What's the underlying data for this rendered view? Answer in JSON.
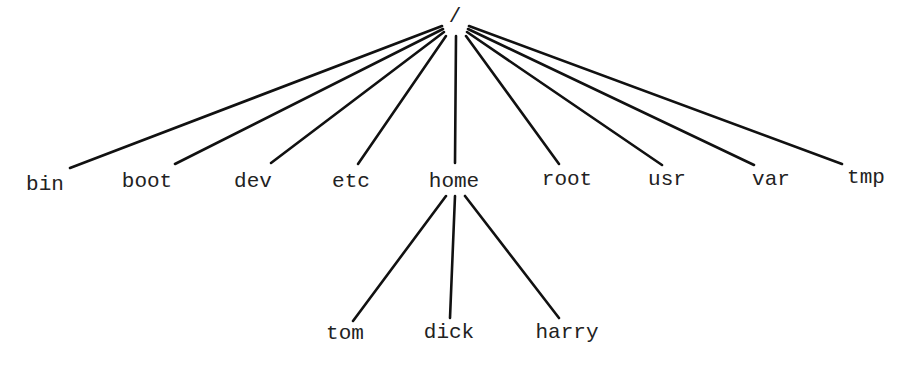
{
  "diagram": {
    "type": "tree",
    "colors": {
      "line": "#111111",
      "text": "#222222",
      "background": "#ffffff"
    },
    "nodes": [
      {
        "id": "root",
        "label": "/",
        "x": 455,
        "y": 22
      },
      {
        "id": "bin",
        "label": "bin",
        "x": 45,
        "y": 190
      },
      {
        "id": "boot",
        "label": "boot",
        "x": 147,
        "y": 187
      },
      {
        "id": "dev",
        "label": "dev",
        "x": 253,
        "y": 187
      },
      {
        "id": "etc",
        "label": "etc",
        "x": 351,
        "y": 187
      },
      {
        "id": "home",
        "label": "home",
        "x": 454,
        "y": 187
      },
      {
        "id": "rootdir",
        "label": "root",
        "x": 567,
        "y": 185
      },
      {
        "id": "usr",
        "label": "usr",
        "x": 667,
        "y": 185
      },
      {
        "id": "var",
        "label": "var",
        "x": 771,
        "y": 185
      },
      {
        "id": "tmp",
        "label": "tmp",
        "x": 866,
        "y": 183
      },
      {
        "id": "tom",
        "label": "tom",
        "x": 345,
        "y": 339
      },
      {
        "id": "dick",
        "label": "dick",
        "x": 449,
        "y": 338
      },
      {
        "id": "harry",
        "label": "harry",
        "x": 567,
        "y": 338
      }
    ],
    "edges": [
      {
        "from": "root",
        "to": "bin",
        "x1": 442,
        "y1": 26,
        "x2": 70,
        "y2": 168
      },
      {
        "from": "root",
        "to": "boot",
        "x1": 443,
        "y1": 29,
        "x2": 175,
        "y2": 164
      },
      {
        "from": "root",
        "to": "dev",
        "x1": 444,
        "y1": 32,
        "x2": 271,
        "y2": 163
      },
      {
        "from": "root",
        "to": "etc",
        "x1": 446,
        "y1": 36,
        "x2": 358,
        "y2": 164
      },
      {
        "from": "root",
        "to": "home",
        "x1": 456,
        "y1": 36,
        "x2": 455,
        "y2": 163
      },
      {
        "from": "root",
        "to": "root",
        "x1": 466,
        "y1": 36,
        "x2": 559,
        "y2": 164
      },
      {
        "from": "root",
        "to": "usr",
        "x1": 467,
        "y1": 32,
        "x2": 662,
        "y2": 165
      },
      {
        "from": "root",
        "to": "var",
        "x1": 468,
        "y1": 29,
        "x2": 754,
        "y2": 165
      },
      {
        "from": "root",
        "to": "tmp",
        "x1": 469,
        "y1": 26,
        "x2": 842,
        "y2": 164
      },
      {
        "from": "home",
        "to": "tom",
        "x1": 446,
        "y1": 196,
        "x2": 353,
        "y2": 321
      },
      {
        "from": "home",
        "to": "dick",
        "x1": 455,
        "y1": 196,
        "x2": 450,
        "y2": 318
      },
      {
        "from": "home",
        "to": "harry",
        "x1": 465,
        "y1": 196,
        "x2": 559,
        "y2": 318
      }
    ]
  }
}
